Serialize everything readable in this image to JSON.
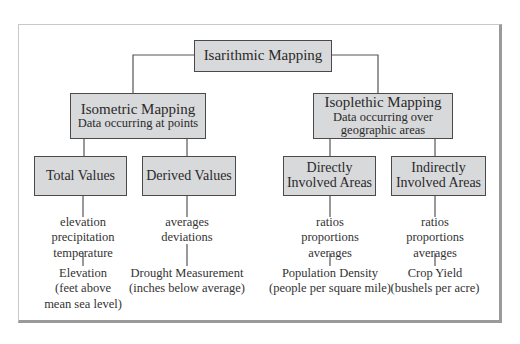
{
  "diagram": {
    "root": {
      "label": "Isarithmic Mapping"
    },
    "branches": [
      {
        "title": "Isometric Mapping",
        "subtitle": "Data occurring at points",
        "children": [
          {
            "label": "Total Values",
            "data_types": [
              "elevation",
              "precipitation",
              "temperature"
            ],
            "example": [
              "Elevation",
              "(feet above",
              "mean sea level)"
            ]
          },
          {
            "label": "Derived Values",
            "data_types": [
              "averages",
              "deviations"
            ],
            "example": [
              "Drought Measurement",
              "(inches below average)"
            ]
          }
        ]
      },
      {
        "title": "Isoplethic Mapping",
        "subtitle": [
          "Data occurring over",
          "geographic areas"
        ],
        "children": [
          {
            "label": [
              "Directly",
              "Involved Areas"
            ],
            "data_types": [
              "ratios",
              "proportions",
              "averages"
            ],
            "example": [
              "Population Density",
              "(people per square mile)"
            ]
          },
          {
            "label": [
              "Indirectly",
              "Involved Areas"
            ],
            "data_types": [
              "ratios",
              "proportions",
              "averages"
            ],
            "example": [
              "Crop Yield",
              "(bushels per acre)"
            ]
          }
        ]
      }
    ],
    "colors": {
      "box_fill": "#d8d9db",
      "box_border": "#4a4a4a",
      "line": "#555555",
      "frame_shadow": "#9a9a9a"
    }
  }
}
